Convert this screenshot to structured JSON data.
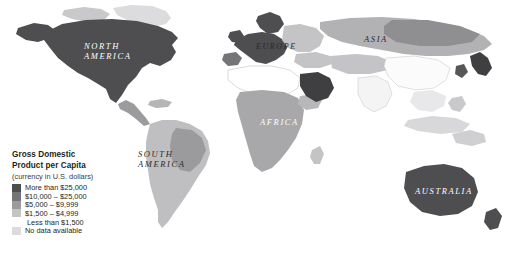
{
  "figure": {
    "type": "choropleth-world-map",
    "background_color": "#ffffff"
  },
  "legend": {
    "title_line1": "Gross Domestic",
    "title_line2": "Product per Capita",
    "subtitle": "(currency in U.S. dollars)",
    "items": [
      {
        "label": "More than $25,000",
        "color": "#4e4d4f"
      },
      {
        "label": "$10,000 – $25,000",
        "color": "#757476"
      },
      {
        "label": "$5,000 – $9,999",
        "color": "#9b9a9c"
      },
      {
        "label": "$1,500 – $4,999",
        "color": "#c4c3c5"
      },
      {
        "label": "Less than $1,500",
        "color": "#ffffff"
      },
      {
        "label": "No data available",
        "color": "#dcdbdd"
      }
    ]
  },
  "map_labels": [
    {
      "name": "north-america",
      "text": "NORTH\nAMERICA",
      "tone": "light"
    },
    {
      "name": "south-america",
      "text": "SOUTH\nAMERICA",
      "tone": "dark"
    },
    {
      "name": "europe",
      "text": "EUROPE",
      "tone": "dark"
    },
    {
      "name": "africa",
      "text": "AFRICA",
      "tone": "light"
    },
    {
      "name": "asia",
      "text": "ASIA",
      "tone": "dark"
    },
    {
      "name": "australia",
      "text": "AUSTRALIA",
      "tone": "light"
    }
  ],
  "chart_data": {
    "type": "heatmap",
    "title": "Gross Domestic Product per Capita",
    "subtitle": "(currency in U.S. dollars)",
    "legend_position": "bottom-left",
    "categories": [
      "More than $25,000",
      "$10,000 – $25,000",
      "$5,000 – $9,999",
      "$1,500 – $4,999",
      "Less than $1,500",
      "No data available"
    ],
    "colors": [
      "#4e4d4f",
      "#757476",
      "#9b9a9c",
      "#c4c3c5",
      "#ffffff",
      "#dcdbdd"
    ],
    "regions": [
      {
        "region": "North America",
        "class": "More than $25,000"
      },
      {
        "region": "Greenland",
        "class": "No data available"
      },
      {
        "region": "South America",
        "class": "$1,500 – $4,999"
      },
      {
        "region": "Western Europe",
        "class": "More than $25,000"
      },
      {
        "region": "Eastern Europe",
        "class": "$1,500 – $4,999"
      },
      {
        "region": "Africa",
        "class": "Less than $1,500"
      },
      {
        "region": "Saudi Arabia",
        "class": "More than $25,000"
      },
      {
        "region": "Russia / North Asia",
        "class": "$1,500 – $4,999"
      },
      {
        "region": "China / South Asia",
        "class": "Less than $1,500"
      },
      {
        "region": "Japan",
        "class": "More than $25,000"
      },
      {
        "region": "Australia",
        "class": "More than $25,000"
      }
    ]
  }
}
